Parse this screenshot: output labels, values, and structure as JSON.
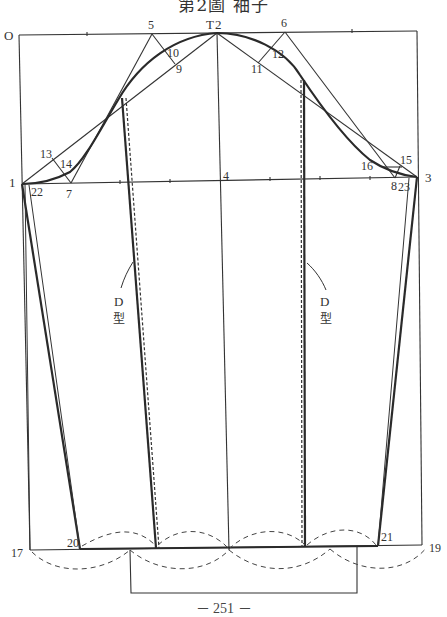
{
  "title": "第2圖 袖子",
  "page_number": "－ 251 －",
  "diagram": {
    "type": "sleeve pattern drafting diagram",
    "points": {
      "O": "O",
      "T": "T",
      "p1": "1",
      "p2": "2",
      "p3": "3",
      "p4": "4",
      "p5": "5",
      "p6": "6",
      "p7": "7",
      "p8": "8",
      "p9": "9",
      "p10": "10",
      "p11": "11",
      "p12": "12",
      "p13": "13",
      "p14": "14",
      "p15": "15",
      "p16": "16",
      "p17": "17",
      "p19": "19",
      "p20": "20",
      "p21": "21",
      "p22": "22",
      "p23": "23"
    },
    "annotations": {
      "left_d_letter": "D",
      "left_d_char": "型",
      "right_d_letter": "D",
      "right_d_char": "型"
    },
    "colors": {
      "line": "#333333",
      "bold_line": "#2a2a2a"
    }
  }
}
